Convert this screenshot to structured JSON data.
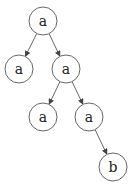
{
  "diagram": {
    "type": "tree",
    "nodes": [
      {
        "id": "n0",
        "label": "a",
        "x": 43,
        "y": 21
      },
      {
        "id": "n1",
        "label": "a",
        "x": 19,
        "y": 69
      },
      {
        "id": "n2",
        "label": "a",
        "x": 66,
        "y": 69
      },
      {
        "id": "n3",
        "label": "a",
        "x": 43,
        "y": 117
      },
      {
        "id": "n4",
        "label": "a",
        "x": 89,
        "y": 117
      },
      {
        "id": "n5",
        "label": "b",
        "x": 113,
        "y": 167
      }
    ],
    "edges": [
      {
        "from": "n0",
        "to": "n1"
      },
      {
        "from": "n0",
        "to": "n2"
      },
      {
        "from": "n2",
        "to": "n3"
      },
      {
        "from": "n2",
        "to": "n4"
      },
      {
        "from": "n4",
        "to": "n5"
      }
    ],
    "node_radius": 14
  }
}
